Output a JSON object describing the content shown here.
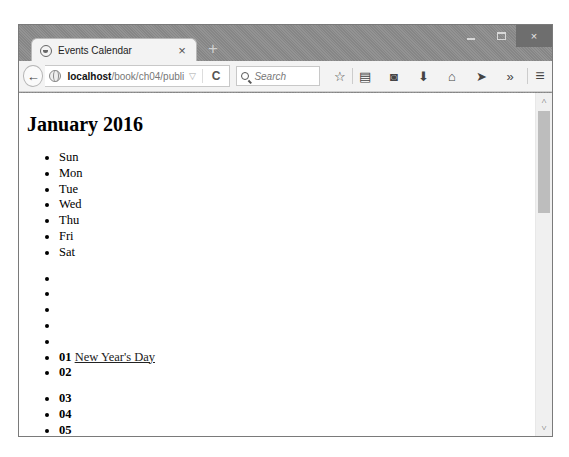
{
  "window": {
    "controls": {
      "minimize": "minimize",
      "maximize": "maximize",
      "close": "×"
    }
  },
  "tab": {
    "title": "Events Calendar",
    "close": "×",
    "new_tab": "+"
  },
  "toolbar": {
    "back": "←",
    "url_host": "localhost",
    "url_path": "/book/ch04/publi",
    "url_dropdown": "▽",
    "reload": "C",
    "search_placeholder": "Search",
    "icons": [
      {
        "name": "bookmark-star-icon",
        "glyph": "☆"
      },
      {
        "name": "reading-list-icon",
        "glyph": "▤"
      },
      {
        "name": "pocket-icon",
        "glyph": "◙"
      },
      {
        "name": "download-icon",
        "glyph": "⬇"
      },
      {
        "name": "home-icon",
        "glyph": "⌂"
      },
      {
        "name": "send-icon",
        "glyph": "➤"
      },
      {
        "name": "overflow-icon",
        "glyph": "»"
      }
    ],
    "menu": "≡"
  },
  "page": {
    "heading": "January 2016",
    "weekdays": [
      "Sun",
      "Mon",
      "Tue",
      "Wed",
      "Thu",
      "Fri",
      "Sat"
    ],
    "week1": [
      {
        "day": "",
        "event": ""
      },
      {
        "day": "",
        "event": ""
      },
      {
        "day": "",
        "event": ""
      },
      {
        "day": "",
        "event": ""
      },
      {
        "day": "",
        "event": ""
      },
      {
        "day": "01",
        "event": "New Year's Day"
      },
      {
        "day": "02",
        "event": ""
      }
    ],
    "week2": [
      {
        "day": "03",
        "event": ""
      },
      {
        "day": "04",
        "event": ""
      },
      {
        "day": "05",
        "event": ""
      }
    ]
  },
  "scrollbar": {
    "up": "˄",
    "down": "˅"
  }
}
